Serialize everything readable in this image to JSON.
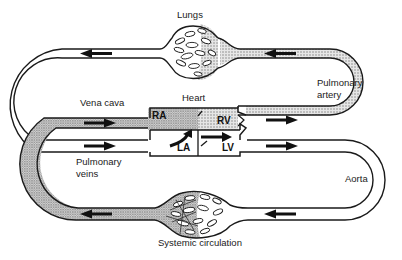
{
  "diagram": {
    "labels": {
      "lungs": "Lungs",
      "heart": "Heart",
      "vena_cava": "Vena cava",
      "pulmonary_artery_line1": "Pulmonary",
      "pulmonary_artery_line2": "artery",
      "pulmonary_veins_line1": "Pulmonary",
      "pulmonary_veins_line2": "veins",
      "aorta": "Aorta",
      "systemic_circulation": "Systemic circulation"
    },
    "chambers": {
      "ra": "RA",
      "rv": "RV",
      "la": "LA",
      "lv": "LV"
    },
    "colors": {
      "outline": "#1a1a1a",
      "deoxygenated_fill": "#c8c8c8",
      "oxygenated_fill": "#ffffff",
      "background": "#ffffff"
    }
  }
}
